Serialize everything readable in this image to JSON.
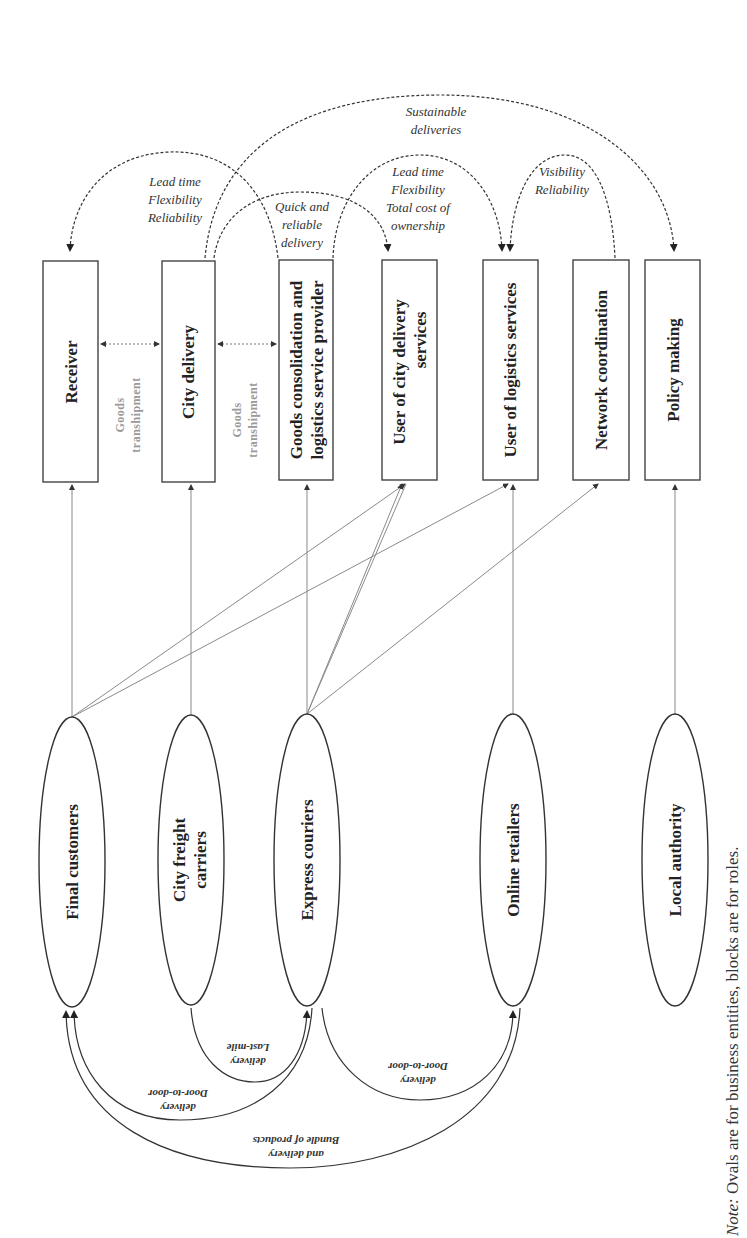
{
  "roles": [
    {
      "id": "receiver",
      "label": [
        "Receiver"
      ]
    },
    {
      "id": "city-delivery",
      "label": [
        "City delivery"
      ]
    },
    {
      "id": "goods-consolidation",
      "label": [
        "Goods consolidation and",
        "logistics service provider"
      ]
    },
    {
      "id": "user-city-delivery",
      "label": [
        "User of city delivery",
        "services"
      ]
    },
    {
      "id": "user-logistics",
      "label": [
        "User of logistics services"
      ]
    },
    {
      "id": "network-coordination",
      "label": [
        "Network coordination"
      ]
    },
    {
      "id": "policy-making",
      "label": [
        "Policy making"
      ]
    }
  ],
  "entities": [
    {
      "id": "final-customers",
      "label": [
        "Final customers"
      ]
    },
    {
      "id": "city-freight-carriers",
      "label": [
        "City freight",
        "carriers"
      ]
    },
    {
      "id": "express-couriers",
      "label": [
        "Express couriers"
      ]
    },
    {
      "id": "online-retailers",
      "label": [
        "Online retailers"
      ]
    },
    {
      "id": "local-authority",
      "label": [
        "Local authority"
      ]
    }
  ],
  "role_relations": [
    {
      "from": "city-delivery",
      "to": "receiver",
      "label": [
        "Lead time",
        "Flexibility",
        "Reliability"
      ]
    },
    {
      "from": "city-delivery",
      "to": "policy-making",
      "label": [
        "Sustainable",
        "deliveries"
      ]
    },
    {
      "from": "city-delivery",
      "to": "user-city-delivery",
      "label": [
        "Quick and",
        "reliable",
        "delivery"
      ]
    },
    {
      "from": "goods-consolidation",
      "to": "user-logistics",
      "label": [
        "Lead time",
        "Flexibility",
        "Total cost of",
        "ownership"
      ]
    },
    {
      "from": "network-coordination",
      "to": "user-logistics",
      "label": [
        "Visibility",
        "Reliability"
      ]
    }
  ],
  "transhipment": [
    {
      "between": [
        "receiver",
        "city-delivery"
      ],
      "label": [
        "Goods",
        "transhipment"
      ]
    },
    {
      "between": [
        "city-delivery",
        "goods-consolidation"
      ],
      "label": [
        "Goods",
        "transhipment"
      ]
    }
  ],
  "entity_flows": [
    {
      "from": "city-freight-carriers",
      "to": "express-couriers",
      "label": [
        "Last-mile",
        "delivery"
      ]
    },
    {
      "from": "express-couriers",
      "to": "final-customers",
      "label": [
        "Door-to-door",
        "delivery"
      ]
    },
    {
      "from": "express-couriers",
      "to": "online-retailers",
      "label": [
        "Door-to-door",
        "delivery"
      ]
    },
    {
      "from": "online-retailers",
      "to": "final-customers",
      "label": [
        "Bundle of products",
        "and delivery"
      ]
    }
  ],
  "entity_role_links": [
    {
      "entity": "final-customers",
      "roles": [
        "receiver",
        "user-city-delivery",
        "user-logistics"
      ]
    },
    {
      "entity": "city-freight-carriers",
      "roles": [
        "city-delivery"
      ]
    },
    {
      "entity": "express-couriers",
      "roles": [
        "goods-consolidation",
        "user-city-delivery",
        "user-logistics",
        "network-coordination"
      ]
    },
    {
      "entity": "online-retailers",
      "roles": [
        "user-logistics"
      ]
    },
    {
      "entity": "local-authority",
      "roles": [
        "policy-making"
      ]
    }
  ],
  "note": {
    "prefix": "Note:",
    "text": " Ovals are for business entities, blocks are for roles."
  }
}
